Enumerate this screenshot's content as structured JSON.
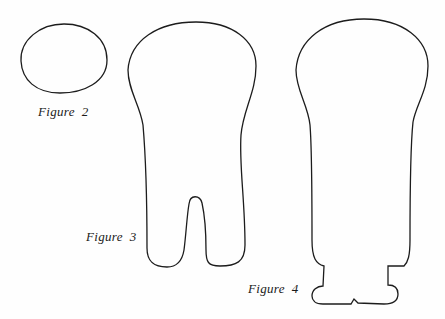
{
  "figures": [
    {
      "id": "figure-2",
      "caption": "Figure  2",
      "shape": "oval outline"
    },
    {
      "id": "figure-3",
      "caption": "Figure  3",
      "shape": "elongated outline with split base (two legs)"
    },
    {
      "id": "figure-4",
      "caption": "Figure  4",
      "shape": "bulb outline with notched flared foot"
    }
  ],
  "colors": {
    "line": "#1c1c1c",
    "background": "#fefefe"
  }
}
